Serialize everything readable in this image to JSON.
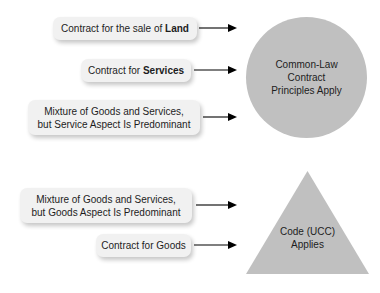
{
  "figure": {
    "type": "flow-diagram",
    "background_color": "#ffffff",
    "box_fill_color": "#f1f1f1",
    "shape_fill_color": "#c0c0c0",
    "text_color": "#1d1d1d",
    "arrow_color": "#000000"
  },
  "groups": [
    {
      "id": "common-law-group",
      "outcome_shape": "circle",
      "outcome_lines": [
        "Common-Law",
        "Contract",
        "Principles Apply"
      ],
      "sources": [
        {
          "id": "land",
          "lines": [
            "Contract for the sale of ",
            "Land"
          ],
          "bold_tail": "Land",
          "plain_head": "Contract for the sale of "
        },
        {
          "id": "services",
          "lines": [
            "Contract for ",
            "Services"
          ],
          "bold_tail": "Services",
          "plain_head": "Contract for "
        },
        {
          "id": "mixture-service-predominant",
          "lines": [
            "Mixture of Goods and Services,",
            "but Service Aspect Is Predominant"
          ]
        }
      ]
    },
    {
      "id": "ucc-group",
      "outcome_shape": "triangle",
      "outcome_lines": [
        "Code (UCC)",
        "Applies"
      ],
      "sources": [
        {
          "id": "mixture-goods-predominant",
          "lines": [
            "Mixture of Goods and Services,",
            "but Goods Aspect Is Predominant"
          ]
        },
        {
          "id": "goods",
          "lines": [
            "Contract for Goods"
          ]
        }
      ]
    }
  ],
  "boxes": {
    "land_plain": "Contract for the sale of ",
    "land_bold": "Land",
    "services_plain": "Contract for ",
    "services_bold": "Services",
    "mixture_service_line1": "Mixture of Goods and Services,",
    "mixture_service_line2": "but Service Aspect Is Predominant",
    "mixture_goods_line1": "Mixture of Goods and Services,",
    "mixture_goods_line2": "but Goods Aspect Is Predominant",
    "goods": "Contract for Goods"
  },
  "circle": {
    "line1": "Common-Law",
    "line2": "Contract",
    "line3": "Principles Apply"
  },
  "triangle": {
    "line1": "Code (UCC)",
    "line2": "Applies"
  },
  "arrows": {
    "icon": "arrow-right-icon",
    "count": 5
  }
}
